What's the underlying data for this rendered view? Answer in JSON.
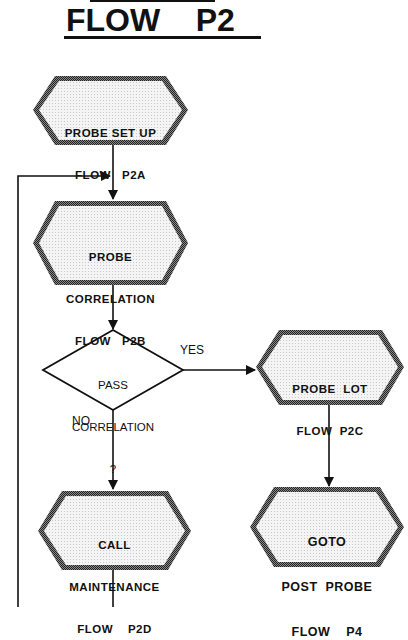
{
  "title": {
    "word1": "FLOW",
    "word2": "P2",
    "text": "FLOW    P2"
  },
  "nodes": [
    {
      "id": "p2a",
      "shape": "hexagon",
      "lines": [
        "PROBE SET UP",
        "FLOW   P2A"
      ]
    },
    {
      "id": "p2b",
      "shape": "hexagon",
      "lines": [
        "PROBE",
        "CORRELATION",
        "FLOW   P2B"
      ]
    },
    {
      "id": "decision",
      "shape": "diamond",
      "lines": [
        "PASS",
        "CORRELATION",
        "?"
      ]
    },
    {
      "id": "p2c",
      "shape": "hexagon",
      "lines": [
        "PROBE  LOT",
        "FLOW  P2C"
      ]
    },
    {
      "id": "p4",
      "shape": "hexagon",
      "lines": [
        "GOTO",
        "POST  PROBE",
        "FLOW    P4"
      ]
    },
    {
      "id": "p2d",
      "shape": "hexagon",
      "lines": [
        "CALL",
        "MAINTENANCE",
        "FLOW    P2D"
      ]
    }
  ],
  "edges": [
    {
      "from": "p2a",
      "to": "p2b",
      "label": ""
    },
    {
      "from": "p2b",
      "to": "decision",
      "label": ""
    },
    {
      "from": "decision",
      "to": "p2c",
      "label": "YES"
    },
    {
      "from": "decision",
      "to": "p2d",
      "label": "NO"
    },
    {
      "from": "p2c",
      "to": "p4",
      "label": ""
    },
    {
      "from": "p2d",
      "to": "loop-back",
      "label": ""
    }
  ],
  "labels": {
    "yes": "YES",
    "no": "NO"
  },
  "colors": {
    "ink": "#111111",
    "fill": "#ececec",
    "border": "#555555",
    "background": "#ffffff"
  }
}
